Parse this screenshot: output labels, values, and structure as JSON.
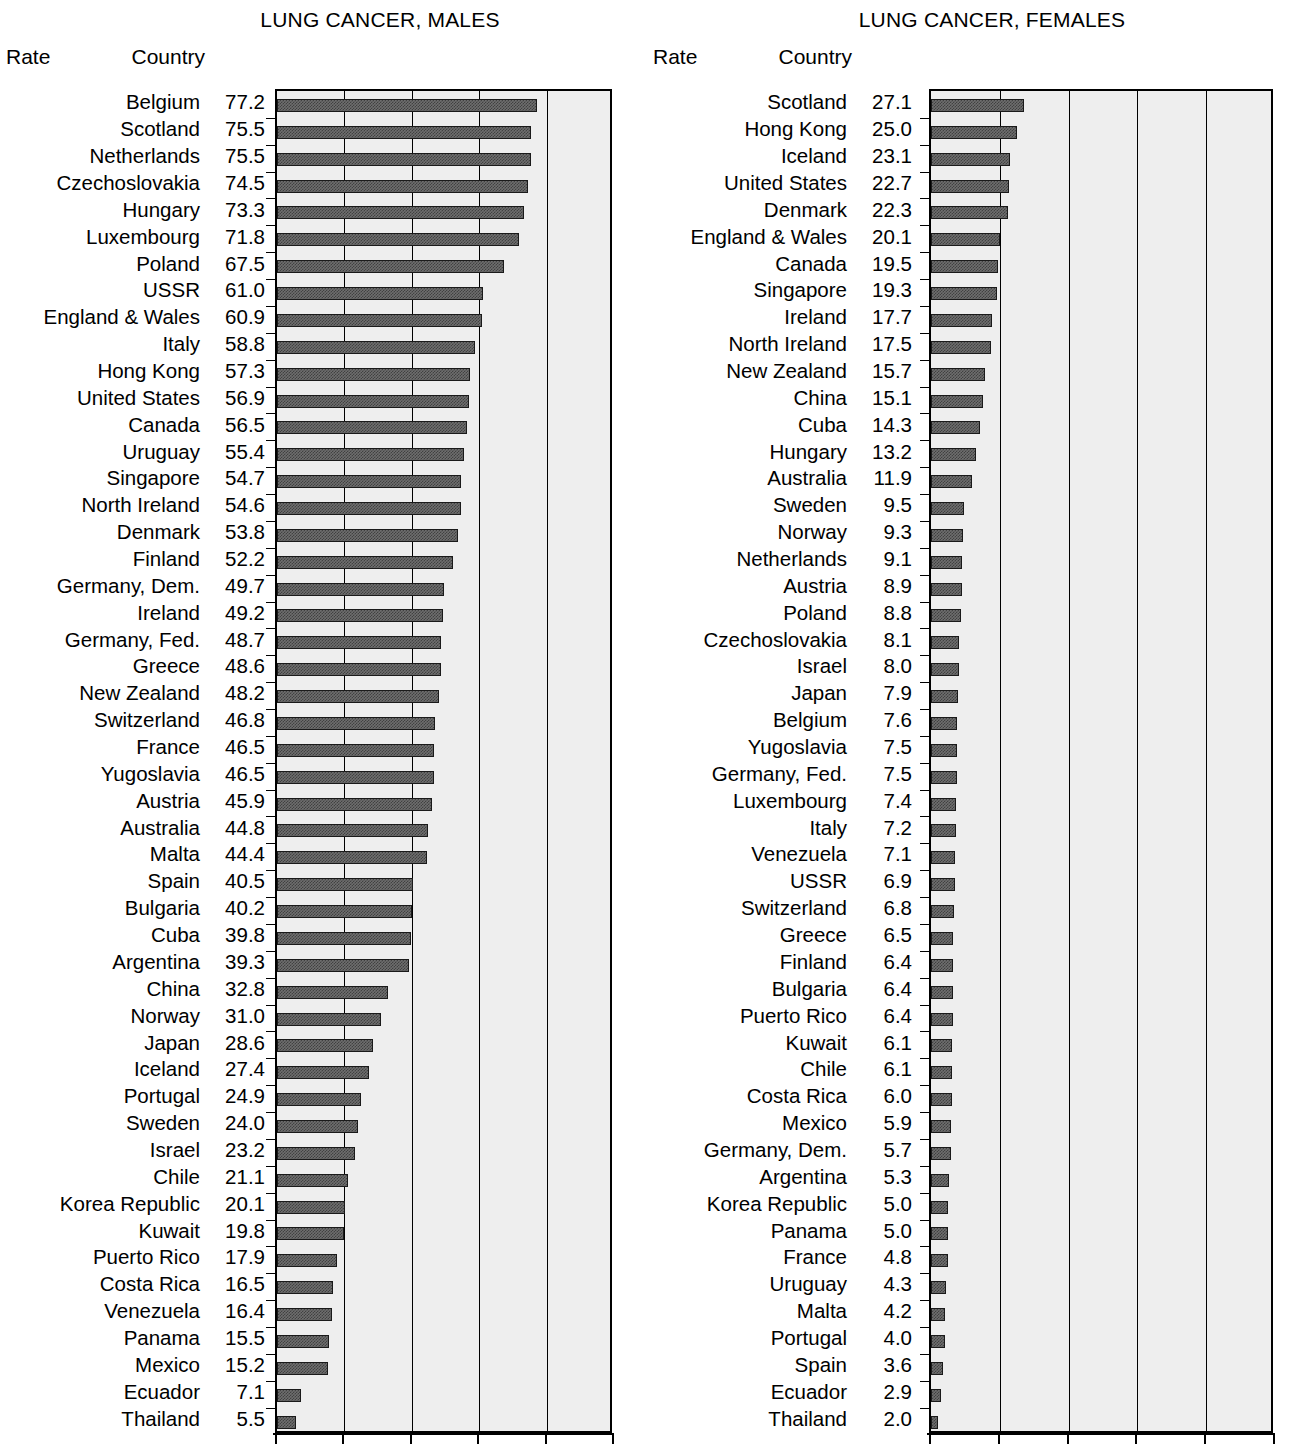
{
  "chart_data": [
    {
      "type": "bar",
      "orientation": "horizontal",
      "title": "LUNG CANCER, MALES",
      "xlabel": "",
      "ylabel": "",
      "column_headers": [
        "Country",
        "Rate"
      ],
      "xlim": [
        0,
        100
      ],
      "xticks": [
        0,
        20,
        40,
        60,
        80,
        100
      ],
      "xtick_labels": [
        "0",
        "20",
        "40",
        "60",
        "80",
        "100"
      ],
      "grid": true,
      "legend": null,
      "categories": [
        "Belgium",
        "Scotland",
        "Netherlands",
        "Czechoslovakia",
        "Hungary",
        "Luxembourg",
        "Poland",
        "USSR",
        "England & Wales",
        "Italy",
        "Hong Kong",
        "United States",
        "Canada",
        "Uruguay",
        "Singapore",
        "North Ireland",
        "Denmark",
        "Finland",
        "Germany, Dem.",
        "Ireland",
        "Germany, Fed.",
        "Greece",
        "New Zealand",
        "Switzerland",
        "France",
        "Yugoslavia",
        "Austria",
        "Australia",
        "Malta",
        "Spain",
        "Bulgaria",
        "Cuba",
        "Argentina",
        "China",
        "Norway",
        "Japan",
        "Iceland",
        "Portugal",
        "Sweden",
        "Israel",
        "Chile",
        "Korea Republic",
        "Kuwait",
        "Puerto Rico",
        "Costa Rica",
        "Venezuela",
        "Panama",
        "Mexico",
        "Ecuador",
        "Thailand"
      ],
      "values": [
        77.2,
        75.5,
        75.5,
        74.5,
        73.3,
        71.8,
        67.5,
        61.0,
        60.9,
        58.8,
        57.3,
        56.9,
        56.5,
        55.4,
        54.7,
        54.6,
        53.8,
        52.2,
        49.7,
        49.2,
        48.7,
        48.6,
        48.2,
        46.8,
        46.5,
        46.5,
        45.9,
        44.8,
        44.4,
        40.5,
        40.2,
        39.8,
        39.3,
        32.8,
        31.0,
        28.6,
        27.4,
        24.9,
        24.0,
        23.2,
        21.1,
        20.1,
        19.8,
        17.9,
        16.5,
        16.4,
        15.5,
        15.2,
        7.1,
        5.5
      ],
      "value_labels": [
        "77.2",
        "75.5",
        "75.5",
        "74.5",
        "73.3",
        "71.8",
        "67.5",
        "61.0",
        "60.9",
        "58.8",
        "57.3",
        "56.9",
        "56.5",
        "55.4",
        "54.7",
        "54.6",
        "53.8",
        "52.2",
        "49.7",
        "49.2",
        "48.7",
        "48.6",
        "48.2",
        "46.8",
        "46.5",
        "46.5",
        "45.9",
        "44.8",
        "44.4",
        "40.5",
        "40.2",
        "39.8",
        "39.3",
        "32.8",
        "31.0",
        "28.6",
        "27.4",
        "24.9",
        "24.0",
        "23.2",
        "21.1",
        "20.1",
        "19.8",
        "17.9",
        "16.5",
        "16.4",
        "15.5",
        "15.2",
        "7.1",
        "5.5"
      ]
    },
    {
      "type": "bar",
      "orientation": "horizontal",
      "title": "LUNG CANCER, FEMALES",
      "xlabel": "",
      "ylabel": "",
      "column_headers": [
        "Country",
        "Rate"
      ],
      "xlim": [
        0,
        100
      ],
      "xticks": [
        0,
        20,
        40,
        60,
        80,
        100
      ],
      "xtick_labels": [
        "0",
        "20",
        "40",
        "60",
        "80",
        "100"
      ],
      "grid": true,
      "legend": null,
      "categories": [
        "Scotland",
        "Hong Kong",
        "Iceland",
        "United States",
        "Denmark",
        "England & Wales",
        "Canada",
        "Singapore",
        "Ireland",
        "North Ireland",
        "New Zealand",
        "China",
        "Cuba",
        "Hungary",
        "Australia",
        "Sweden",
        "Norway",
        "Netherlands",
        "Austria",
        "Poland",
        "Czechoslovakia",
        "Israel",
        "Japan",
        "Belgium",
        "Yugoslavia",
        "Germany, Fed.",
        "Luxembourg",
        "Italy",
        "Venezuela",
        "USSR",
        "Switzerland",
        "Greece",
        "Finland",
        "Bulgaria",
        "Puerto Rico",
        "Kuwait",
        "Chile",
        "Costa Rica",
        "Mexico",
        "Germany, Dem.",
        "Argentina",
        "Korea Republic",
        "Panama",
        "France",
        "Uruguay",
        "Malta",
        "Portugal",
        "Spain",
        "Ecuador",
        "Thailand"
      ],
      "values": [
        27.1,
        25.0,
        23.1,
        22.7,
        22.3,
        20.1,
        19.5,
        19.3,
        17.7,
        17.5,
        15.7,
        15.1,
        14.3,
        13.2,
        11.9,
        9.5,
        9.3,
        9.1,
        8.9,
        8.8,
        8.1,
        8.0,
        7.9,
        7.6,
        7.5,
        7.5,
        7.4,
        7.2,
        7.1,
        6.9,
        6.8,
        6.5,
        6.4,
        6.4,
        6.4,
        6.1,
        6.1,
        6.0,
        5.9,
        5.7,
        5.3,
        5.0,
        5.0,
        4.8,
        4.3,
        4.2,
        4.0,
        3.6,
        2.9,
        2.0
      ],
      "value_labels": [
        "27.1",
        "25.0",
        "23.1",
        "22.7",
        "22.3",
        "20.1",
        "19.5",
        "19.3",
        "17.7",
        "17.5",
        "15.7",
        "15.1",
        "14.3",
        "13.2",
        "11.9",
        "9.5",
        "9.3",
        "9.1",
        "8.9",
        "8.8",
        "8.1",
        "8.0",
        "7.9",
        "7.6",
        "7.5",
        "7.5",
        "7.4",
        "7.2",
        "7.1",
        "6.9",
        "6.8",
        "6.5",
        "6.4",
        "6.4",
        "6.4",
        "6.1",
        "6.1",
        "6.0",
        "5.9",
        "5.7",
        "5.3",
        "5.0",
        "5.0",
        "4.8",
        "4.3",
        "4.2",
        "4.0",
        "3.6",
        "2.9",
        "2.0"
      ]
    }
  ],
  "colors": {
    "bar_fill": "#6e6e6e",
    "bar_stroke": "#1a1a1a",
    "plot_background": "#eeeeee",
    "axis": "#000000",
    "text": "#000000",
    "page_background": "#ffffff"
  }
}
